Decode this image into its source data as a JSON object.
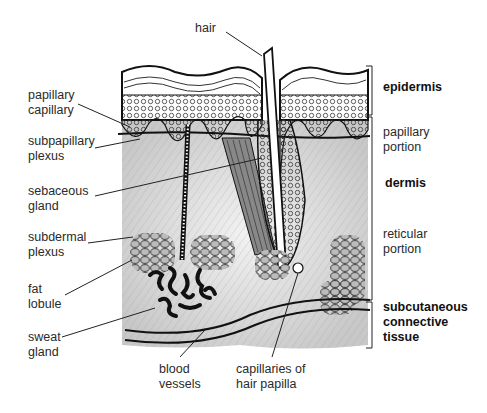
{
  "diagram": {
    "left_labels": [
      {
        "id": "papillary-capillary",
        "text": "papillary\ncapillary"
      },
      {
        "id": "subpapillary-plexus",
        "text": "subpapillary\nplexus"
      },
      {
        "id": "sebaceous-gland",
        "text": "sebaceous\ngland"
      },
      {
        "id": "subdermal-plexus",
        "text": "subdermal\nplexus"
      },
      {
        "id": "fat-lobule",
        "text": "fat\nlobule"
      },
      {
        "id": "sweat-gland",
        "text": "sweat\ngland"
      }
    ],
    "top_label": {
      "id": "hair",
      "text": "hair"
    },
    "bottom_labels": [
      {
        "id": "blood-vessels",
        "text": "blood\nvessels"
      },
      {
        "id": "capillaries-of-hair-papilla",
        "text": "capillaries of\nhair papilla"
      }
    ],
    "right_labels": [
      {
        "id": "epidermis",
        "text": "epidermis",
        "bold": true
      },
      {
        "id": "papillary-portion",
        "text": "papillary\nportion",
        "bold": false
      },
      {
        "id": "dermis",
        "text": "dermis",
        "bold": true
      },
      {
        "id": "reticular-portion",
        "text": "reticular\nportion",
        "bold": false
      },
      {
        "id": "subcutaneous-connective-tissue",
        "text": "subcutaneous\nconnective\ntissue",
        "bold": true
      }
    ],
    "layers": [
      {
        "name": "epidermis",
        "bracket": [
          66,
          115
        ]
      },
      {
        "name": "dermis",
        "bracket": [
          117,
          300
        ]
      },
      {
        "name": "subcutaneous connective tissue",
        "bracket": [
          302,
          348
        ]
      }
    ]
  }
}
